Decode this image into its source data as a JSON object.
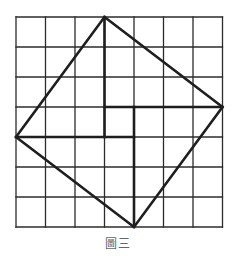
{
  "figure": {
    "caption": "圖三",
    "grid": {
      "rows": 7,
      "cols": 7,
      "origin_px": [
        16,
        17
      ],
      "cell_px": [
        29.5,
        30
      ],
      "line_color": "#2b2b2b"
    },
    "tilted_square": {
      "vertices_grid": [
        [
          3,
          0
        ],
        [
          7,
          3
        ],
        [
          4,
          7
        ],
        [
          0,
          4
        ]
      ],
      "stroke": "#1e1e1e"
    },
    "inner_segments_grid": [
      [
        [
          3,
          0
        ],
        [
          3,
          4
        ]
      ],
      [
        [
          3,
          3
        ],
        [
          7,
          3
        ]
      ],
      [
        [
          4,
          3
        ],
        [
          4,
          7
        ]
      ],
      [
        [
          0,
          4
        ],
        [
          4,
          4
        ]
      ]
    ],
    "center_square_grid": [
      [
        3,
        3
      ],
      [
        4,
        4
      ]
    ]
  }
}
